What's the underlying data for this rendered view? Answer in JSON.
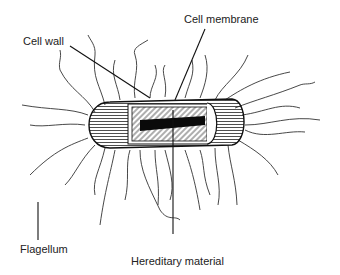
{
  "diagram": {
    "labels": {
      "cell_wall": "Cell wall",
      "cell_membrane": "Cell membrane",
      "flagellum": "Flagellum",
      "hereditary_material": "Hereditary material"
    }
  }
}
